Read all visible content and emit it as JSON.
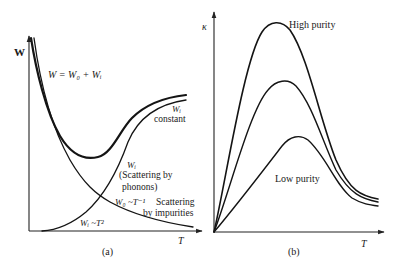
{
  "panels": [
    {
      "id": "a",
      "caption": "(a)",
      "y_axis_label": "W",
      "x_axis_label": "T",
      "equation": "W = W₀ + Wᵢ",
      "labels": {
        "wi_constant_symbol": "Wᵢ",
        "wi_constant_text": "constant",
        "wi_phonons_symbol": "Wᵢ",
        "wi_phonons_line1": "(Scattering by",
        "wi_phonons_line2": "phonons)",
        "w0_relation": "W₀ ~T⁻¹",
        "impurities_line1": "Scattering",
        "impurities_line2": "by impurities",
        "wi_t2_relation": "Wᵢ ~T²"
      },
      "curves": [
        {
          "name": "total-W",
          "description": "W = W0 + Wi, falls steeply then rises after a minimum"
        },
        {
          "name": "W0-impurities",
          "description": "W0 ~ T^-1, monotonically decreasing"
        },
        {
          "name": "Wi-phonons",
          "description": "Wi ~ T^2 at low T, saturating to constant at high T"
        }
      ]
    },
    {
      "id": "b",
      "caption": "(b)",
      "y_axis_label": "κ",
      "x_axis_label": "T",
      "labels": {
        "high_purity": "High purity",
        "low_purity": "Low purity"
      },
      "curves": [
        {
          "name": "high-purity",
          "description": "Highest peak, thermal conductivity"
        },
        {
          "name": "medium-purity",
          "description": "Intermediate peak"
        },
        {
          "name": "low-purity",
          "description": "Lowest, broadest peak"
        }
      ]
    }
  ]
}
